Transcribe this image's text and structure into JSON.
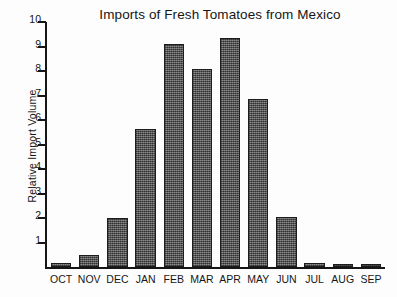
{
  "chart_data": {
    "type": "bar",
    "title": "Imports of Fresh Tomatoes from Mexico",
    "xlabel": "",
    "ylabel": "Relative Import Volume",
    "categories": [
      "OCT",
      "NOV",
      "DEC",
      "JAN",
      "FEB",
      "MAR",
      "APR",
      "MAY",
      "JUN",
      "JUL",
      "AUG",
      "SEP"
    ],
    "values": [
      0.15,
      0.5,
      2.0,
      5.65,
      9.1,
      8.1,
      9.35,
      6.85,
      2.05,
      0.15,
      0.1,
      0.05
    ],
    "ylim": [
      0,
      10
    ],
    "ytick_labels": [
      "10",
      "9",
      "8",
      "7",
      "6",
      "5",
      "4",
      "3",
      "2",
      "1"
    ],
    "ytick_values": [
      10,
      9,
      8,
      7,
      6,
      5,
      4,
      3,
      2,
      1
    ],
    "grid": false,
    "legend": false,
    "bar_fill_color": "#5f5f5f",
    "bar_edge_color": "#1c1c1c",
    "axis_color": "#161616",
    "background_color": "#fdfdfd"
  }
}
